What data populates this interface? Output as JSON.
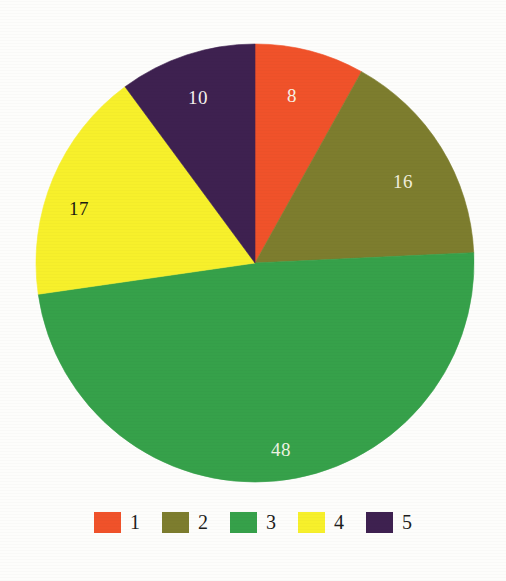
{
  "chart_data": {
    "type": "pie",
    "title": "",
    "subtitle": "",
    "xlabel": "",
    "ylabel": "",
    "legend_position": "bottom",
    "grid": false,
    "categories": [
      "1",
      "2",
      "3",
      "4",
      "5"
    ],
    "values": [
      8,
      16,
      48,
      17,
      10
    ],
    "total": 99,
    "slices": [
      {
        "name": "1",
        "label": "8",
        "value": 8,
        "color": "#f0522a",
        "label_color": "#f7f0e4",
        "start_angle": 0,
        "end_angle": 29.1,
        "label_x": 292,
        "label_y": 98
      },
      {
        "name": "2",
        "label": "16",
        "value": 16,
        "color": "#7d7d2e",
        "label_color": "#f2efdc",
        "start_angle": 29.1,
        "end_angle": 87.3,
        "label_x": 403,
        "label_y": 184
      },
      {
        "name": "3",
        "label": "48",
        "value": 48,
        "color": "#36a14a",
        "label_color": "#eef3e2",
        "start_angle": 87.3,
        "end_angle": 261.8,
        "label_x": 281,
        "label_y": 452
      },
      {
        "name": "4",
        "label": "17",
        "value": 17,
        "color": "#f7f02b",
        "label_color": "#1a1a12",
        "start_angle": 261.8,
        "end_angle": 323.6,
        "label_x": 79,
        "label_y": 211
      },
      {
        "name": "5",
        "label": "10",
        "value": 10,
        "color": "#3e2150",
        "label_color": "#f5f1ee",
        "start_angle": 323.6,
        "end_angle": 360,
        "label_x": 198,
        "label_y": 100
      }
    ],
    "geometry": {
      "center_x": 255,
      "center_y": 263,
      "radius": 219
    },
    "legend": [
      {
        "label": "1",
        "color": "#f0522a"
      },
      {
        "label": "2",
        "color": "#7d7d2e"
      },
      {
        "label": "3",
        "color": "#36a14a"
      },
      {
        "label": "4",
        "color": "#f7f02b"
      },
      {
        "label": "5",
        "color": "#3e2150"
      }
    ]
  }
}
